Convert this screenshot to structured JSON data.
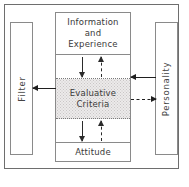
{
  "diagram": {
    "frame": {
      "name": "outer-frame"
    },
    "boxes": {
      "filter": {
        "label": "Filter",
        "orientation": "vertical"
      },
      "personality": {
        "label": "Personality",
        "orientation": "vertical"
      },
      "information": {
        "label": "Information\nand\nExperience",
        "line1": "Information",
        "line2": "and",
        "line3": "Experience"
      },
      "evaluative": {
        "label": "Evaluative\nCriteria",
        "line1": "Evaluative",
        "line2": "Criteria",
        "fill": "#eceaea",
        "shaded": "true"
      },
      "attitude": {
        "label": "Attitude"
      }
    },
    "arrows": {
      "info_to_evaluative": {
        "style": "solid",
        "direction": "down"
      },
      "evaluative_to_info": {
        "style": "dashed",
        "direction": "up"
      },
      "evaluative_to_attitude": {
        "style": "solid",
        "direction": "down"
      },
      "attitude_to_evaluative": {
        "style": "dashed",
        "direction": "up"
      },
      "evaluative_to_filter": {
        "style": "solid",
        "direction": "left"
      },
      "personality_to_evaluative": {
        "style": "solid",
        "direction": "left"
      },
      "evaluative_to_personality": {
        "style": "dashed",
        "direction": "right"
      }
    },
    "colors": {
      "frame_border": "#6e6e6e",
      "box_border": "#8a8a8a",
      "text": "#3a3a3a",
      "arrow": "#1f1f1f",
      "shade_fill": "#eceaea",
      "background": "#ffffff"
    }
  }
}
